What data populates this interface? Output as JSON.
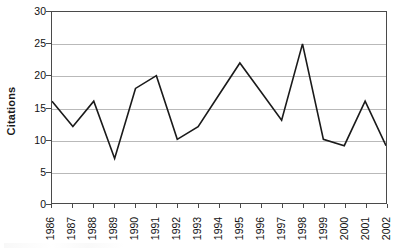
{
  "chart_data": {
    "type": "line",
    "title": "",
    "xlabel": "",
    "ylabel": "Citations",
    "categories": [
      "1986",
      "1987",
      "1988",
      "1989",
      "1990",
      "1991",
      "1992",
      "1993",
      "1994",
      "1995",
      "1996",
      "1997",
      "1998",
      "1999",
      "2000",
      "2001",
      "2002"
    ],
    "values": [
      16,
      12,
      16,
      7,
      18,
      20,
      10,
      12,
      17,
      22,
      17.5,
      13,
      25,
      10,
      9,
      16,
      9
    ],
    "series": [
      {
        "name": "Citations",
        "values": [
          16,
          12,
          16,
          7,
          18,
          20,
          10,
          12,
          17,
          22,
          17.5,
          13,
          25,
          10,
          9,
          16,
          9
        ]
      }
    ],
    "ylim": [
      0,
      30
    ],
    "yticks": [
      0,
      5,
      10,
      15,
      20,
      25,
      30
    ],
    "ytick_labels": [
      "0",
      "5",
      "10",
      "15",
      "20",
      "25",
      "30"
    ],
    "grid": true,
    "grid_axis": "y",
    "legend": false,
    "legend_position": "none",
    "line_color": "#1a1a1a",
    "grid_color": "#b9b9b9",
    "axis_color": "#4a4a4a",
    "background_color": "#ffffff",
    "markers": false,
    "xtick_rotation": -90
  }
}
